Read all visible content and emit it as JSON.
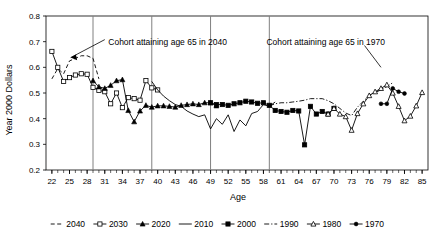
{
  "chart_data": {
    "type": "line",
    "title": "",
    "xlabel": "Age",
    "ylabel": "Year 2000 Dollars",
    "xlim": [
      21,
      86
    ],
    "ylim": [
      0.2,
      0.8
    ],
    "yticks": [
      "0.2",
      "0.3",
      "0.4",
      "0.5",
      "0.6",
      "0.7",
      "0.8"
    ],
    "xticks": [
      "22",
      "25",
      "28",
      "31",
      "34",
      "37",
      "40",
      "43",
      "46",
      "49",
      "52",
      "55",
      "58",
      "61",
      "64",
      "67",
      "70",
      "73",
      "76",
      "79",
      "82",
      "85"
    ],
    "grid": false,
    "legend_position": "bottom",
    "reference_lines_x": [
      29,
      39,
      49,
      59
    ],
    "annotations": [
      {
        "text": "Cohort attaining age 65 in 2040",
        "x": 31,
        "y": 0.7
      },
      {
        "text": "Cohort attaining age 65 in 1970",
        "x": 59,
        "y": 0.7
      }
    ],
    "series": [
      {
        "name": "2040",
        "marker": "none",
        "dash": "dashed",
        "x": [
          22,
          23,
          24,
          25,
          26,
          27,
          28,
          29,
          30
        ],
        "y": [
          0.555,
          0.595,
          0.575,
          0.625,
          0.635,
          0.645,
          0.645,
          0.635,
          0.555
        ]
      },
      {
        "name": "2030",
        "marker": "open-square",
        "dash": "solid",
        "x": [
          22,
          23,
          24,
          25,
          26,
          27,
          28,
          29,
          30,
          31,
          32,
          33,
          34,
          35,
          36,
          37,
          38,
          39,
          40
        ],
        "y": [
          0.662,
          0.6,
          0.545,
          0.56,
          0.57,
          0.575,
          0.573,
          0.522,
          0.51,
          0.505,
          0.458,
          0.5,
          0.443,
          0.482,
          0.478,
          0.472,
          0.548,
          0.52,
          0.512
        ]
      },
      {
        "name": "2020",
        "marker": "filled-triangle",
        "dash": "solid",
        "x": [
          29,
          30,
          31,
          32,
          33,
          34,
          35,
          36,
          37,
          38,
          39,
          40,
          41,
          42,
          43,
          44,
          45,
          46,
          47,
          48,
          49,
          50
        ],
        "y": [
          0.548,
          0.524,
          0.518,
          0.53,
          0.548,
          0.552,
          0.432,
          0.388,
          0.43,
          0.452,
          0.445,
          0.45,
          0.45,
          0.448,
          0.445,
          0.452,
          0.455,
          0.458,
          0.455,
          0.462,
          0.462,
          0.45
        ]
      },
      {
        "name": "2010",
        "marker": "none",
        "dash": "solid",
        "x": [
          39,
          40,
          41,
          42,
          43,
          44,
          45,
          46,
          47,
          48,
          49,
          50,
          51,
          52,
          53,
          54,
          55,
          56,
          57,
          58,
          59,
          60
        ],
        "y": [
          0.545,
          0.512,
          0.488,
          0.47,
          0.455,
          0.448,
          0.43,
          0.418,
          0.408,
          0.415,
          0.36,
          0.4,
          0.378,
          0.415,
          0.35,
          0.395,
          0.372,
          0.42,
          0.428,
          0.455,
          0.448,
          0.465
        ]
      },
      {
        "name": "2000",
        "marker": "filled-square",
        "dash": "solid",
        "x": [
          49,
          50,
          51,
          52,
          53,
          54,
          55,
          56,
          57,
          58,
          59,
          60,
          61,
          62,
          63,
          64,
          65,
          66,
          67,
          68,
          69,
          70
        ],
        "y": [
          0.462,
          0.455,
          0.455,
          0.452,
          0.458,
          0.462,
          0.468,
          0.465,
          0.46,
          0.462,
          0.452,
          0.432,
          0.428,
          0.425,
          0.432,
          0.43,
          0.298,
          0.448,
          0.418,
          0.428,
          0.418,
          0.44
        ]
      },
      {
        "name": "1990",
        "marker": "none",
        "dash": "dash-dot",
        "x": [
          59,
          60,
          61,
          62,
          63,
          64,
          65,
          66,
          67,
          68,
          69,
          70,
          71,
          72,
          73,
          74,
          75,
          76,
          77,
          78,
          79,
          80
        ],
        "y": [
          0.45,
          0.458,
          0.462,
          0.462,
          0.465,
          0.468,
          0.472,
          0.478,
          0.478,
          0.478,
          0.47,
          0.458,
          0.44,
          0.422,
          0.412,
          0.445,
          0.468,
          0.49,
          0.502,
          0.512,
          0.525,
          0.54
        ]
      },
      {
        "name": "1980",
        "marker": "open-triangle",
        "dash": "solid",
        "x": [
          69,
          70,
          71,
          72,
          73,
          74,
          75,
          76,
          77,
          78,
          79,
          80,
          81,
          82,
          83,
          84,
          85
        ],
        "y": [
          0.418,
          0.44,
          0.418,
          0.408,
          0.355,
          0.42,
          0.458,
          0.49,
          0.505,
          0.518,
          0.532,
          0.5,
          0.448,
          0.392,
          0.41,
          0.45,
          0.502
        ]
      },
      {
        "name": "1970",
        "marker": "filled-dot",
        "dash": "solid",
        "x": [
          78,
          79,
          80,
          81,
          82
        ],
        "y": [
          0.458,
          0.458,
          0.518,
          0.505,
          0.498
        ]
      }
    ]
  },
  "legend": {
    "entries": [
      {
        "label": "2040",
        "style": "dashed",
        "marker": "none"
      },
      {
        "label": "2030",
        "style": "solid",
        "marker": "open-square"
      },
      {
        "label": "2020",
        "style": "solid",
        "marker": "filled-triangle"
      },
      {
        "label": "2010",
        "style": "solid",
        "marker": "none"
      },
      {
        "label": "2000",
        "style": "solid",
        "marker": "filled-square"
      },
      {
        "label": "1990",
        "style": "dash-dot",
        "marker": "none"
      },
      {
        "label": "1980",
        "style": "solid",
        "marker": "open-triangle"
      },
      {
        "label": "1970",
        "style": "solid",
        "marker": "filled-dot"
      }
    ]
  },
  "colors": {
    "line": "#000000",
    "axis": "#000000",
    "reference_line": "#808080",
    "background": "#ffffff"
  }
}
